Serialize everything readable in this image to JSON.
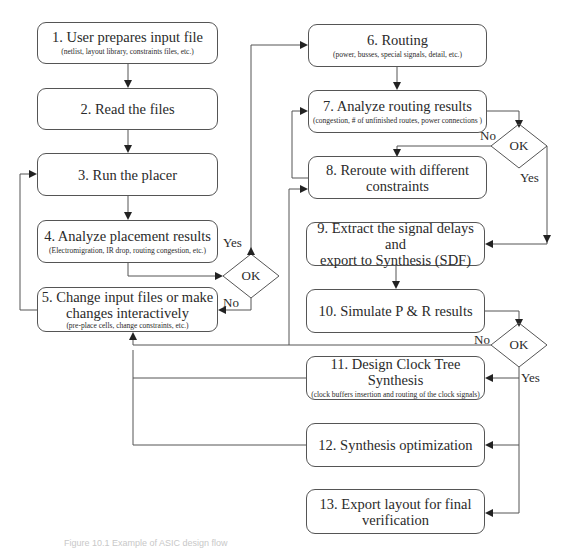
{
  "diagram": {
    "type": "flowchart",
    "caption": "Figure 10.1  Example of ASIC design flow",
    "steps": [
      {
        "id": 1,
        "title": "1. User prepares input file",
        "detail": "(netlist, layout library, constraints files, etc.)"
      },
      {
        "id": 2,
        "title": "2. Read the files",
        "detail": ""
      },
      {
        "id": 3,
        "title": "3. Run the placer",
        "detail": ""
      },
      {
        "id": 4,
        "title": "4. Analyze placement results",
        "detail": "(Electromigration, IR drop, routing congestion, etc.)"
      },
      {
        "id": 5,
        "title": "5. Change input files or make changes interactively",
        "title_line1": "5. Change input files or make",
        "title_line2": "changes interactively",
        "detail": "(pre-place cells, change constraints, etc.)"
      },
      {
        "id": 6,
        "title": "6. Routing",
        "detail": "(power, busses, special signals, detail, etc.)"
      },
      {
        "id": 7,
        "title": "7. Analyze routing results",
        "detail": "(congestion, # of unfinished routes, power connections )"
      },
      {
        "id": 8,
        "title": "8. Reroute with different constraints",
        "title_line1": "8. Reroute with different",
        "title_line2": "constraints",
        "detail": ""
      },
      {
        "id": 9,
        "title": "9. Extract the signal delays and export to Synthesis (SDF)",
        "title_line1": "9. Extract the signal delays and",
        "title_line2": "export to Synthesis (SDF)",
        "detail": ""
      },
      {
        "id": 10,
        "title": "10. Simulate P & R results",
        "detail": ""
      },
      {
        "id": 11,
        "title": "11. Design Clock Tree Synthesis",
        "detail": "(clock buffers insertion and routing of the clock signals)"
      },
      {
        "id": 12,
        "title": "12. Synthesis optimization",
        "detail": ""
      },
      {
        "id": 13,
        "title": "13. Export layout for final verification",
        "title_line1": "13. Export layout for final",
        "title_line2": "verification",
        "detail": ""
      }
    ],
    "decisions": [
      {
        "id": "d1",
        "label": "OK",
        "after_step": 4,
        "yes_label": "Yes",
        "no_label": "No",
        "yes_to": 6,
        "no_to": 5
      },
      {
        "id": "d2",
        "label": "OK",
        "after_step": 7,
        "yes_label": "Yes",
        "no_label": "No",
        "yes_to": 9,
        "no_to": 8
      },
      {
        "id": "d3",
        "label": "OK",
        "after_step": 10,
        "yes_label": "Yes",
        "no_label": "No",
        "yes_to": [
          11,
          12,
          13
        ],
        "no_to": 5
      }
    ],
    "edges": [
      {
        "from": 1,
        "to": 2
      },
      {
        "from": 2,
        "to": 3
      },
      {
        "from": 3,
        "to": 4
      },
      {
        "from": 4,
        "to": "d1"
      },
      {
        "from": "d1",
        "to": 6,
        "label": "Yes"
      },
      {
        "from": "d1",
        "to": 5,
        "label": "No"
      },
      {
        "from": 5,
        "to": 3
      },
      {
        "from": 6,
        "to": 7
      },
      {
        "from": 7,
        "to": "d2"
      },
      {
        "from": "d2",
        "to": 8,
        "label": "No"
      },
      {
        "from": "d2",
        "to": 9,
        "label": "Yes"
      },
      {
        "from": 8,
        "to": 7
      },
      {
        "from": 9,
        "to": 10
      },
      {
        "from": 10,
        "to": "d3"
      },
      {
        "from": "d3",
        "to": 5,
        "label": "No"
      },
      {
        "from": "d3",
        "to": 11,
        "label": "Yes"
      },
      {
        "from": "d3",
        "to": 12
      },
      {
        "from": "d3",
        "to": 13
      },
      {
        "from": 11,
        "to": 5
      },
      {
        "from": 12,
        "to": 5
      },
      {
        "from": 5,
        "to": 8
      }
    ]
  }
}
